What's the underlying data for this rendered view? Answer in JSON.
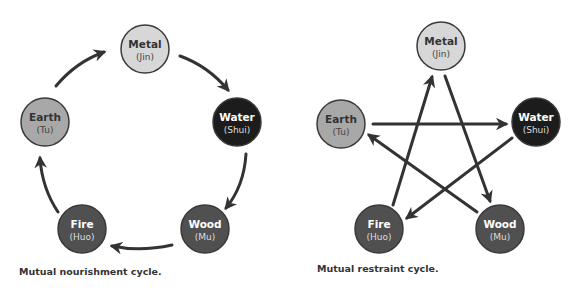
{
  "colors": {
    "arrow": "#333333",
    "outline": "#3a3a3a",
    "metal": "#d7d7d7",
    "earth": "#a8a8a8",
    "water": "#1c1c1c",
    "fire": "#505050",
    "wood": "#505050",
    "text_dark": "#333333",
    "text_light": "#ffffff"
  },
  "left_diagram": {
    "caption": "Mutual nourishment cycle.",
    "nodes": {
      "metal": {
        "name": "Metal",
        "sub": "(Jin)"
      },
      "water": {
        "name": "Water",
        "sub": "(Shui)"
      },
      "wood": {
        "name": "Wood",
        "sub": "(Mu)"
      },
      "fire": {
        "name": "Fire",
        "sub": "(Huo)"
      },
      "earth": {
        "name": "Earth",
        "sub": "(Tu)"
      }
    },
    "edges": [
      {
        "from": "Metal",
        "to": "Water"
      },
      {
        "from": "Water",
        "to": "Wood"
      },
      {
        "from": "Wood",
        "to": "Fire"
      },
      {
        "from": "Fire",
        "to": "Earth"
      },
      {
        "from": "Earth",
        "to": "Metal"
      }
    ]
  },
  "right_diagram": {
    "caption": "Mutual restraint cycle.",
    "nodes": {
      "metal": {
        "name": "Metal",
        "sub": "(Jin)"
      },
      "water": {
        "name": "Water",
        "sub": "(Shui)"
      },
      "wood": {
        "name": "Wood",
        "sub": "(Mu)"
      },
      "fire": {
        "name": "Fire",
        "sub": "(Huo)"
      },
      "earth": {
        "name": "Earth",
        "sub": "(Tu)"
      }
    },
    "edges": [
      {
        "from": "Metal",
        "to": "Wood"
      },
      {
        "from": "Wood",
        "to": "Earth"
      },
      {
        "from": "Earth",
        "to": "Water"
      },
      {
        "from": "Water",
        "to": "Fire"
      },
      {
        "from": "Fire",
        "to": "Metal"
      }
    ]
  }
}
